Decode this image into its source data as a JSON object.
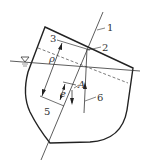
{
  "diagram": {
    "type": "ship-stability-cross-section",
    "labels": {
      "l1": "1",
      "l2": "2",
      "l3": "3",
      "l4": "A",
      "l5": "5",
      "l6": "6",
      "rho": "ρ",
      "e": "e",
      "waterline_symbol": "∇"
    },
    "colors": {
      "stroke": "#222222",
      "background": "#ffffff"
    }
  }
}
